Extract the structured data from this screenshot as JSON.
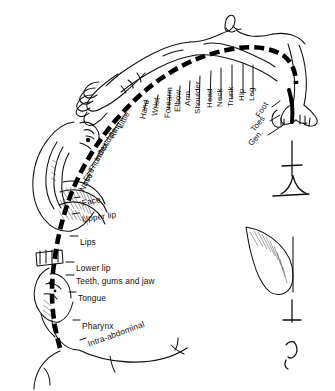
{
  "figure": {
    "name": "sensory-homunculus",
    "background_color": "#ffffff",
    "ink_color": "#000000",
    "arc": {
      "name": "cortical-sensory-strip",
      "style": "dashed-thick-black-arc"
    },
    "labels_upper": [
      {
        "text": "Little",
        "x": 120,
        "y": 124,
        "rot": -62
      },
      {
        "text": "Ring",
        "x": 112,
        "y": 134,
        "rot": -62
      },
      {
        "text": "Middle",
        "x": 104,
        "y": 146,
        "rot": -62
      },
      {
        "text": "Index",
        "x": 97,
        "y": 157,
        "rot": -62
      },
      {
        "text": "Thumb",
        "x": 91,
        "y": 168,
        "rot": -62
      },
      {
        "text": "Eye",
        "x": 86,
        "y": 177,
        "rot": -62
      },
      {
        "text": "Nose",
        "x": 82,
        "y": 187,
        "rot": -62
      },
      {
        "text": "Hand",
        "x": 143,
        "y": 115,
        "rot": -78
      },
      {
        "text": "Wrist",
        "x": 155,
        "y": 112,
        "rot": -82
      },
      {
        "text": "Forearm",
        "x": 168,
        "y": 114,
        "rot": -86
      },
      {
        "text": "Elbow",
        "x": 178,
        "y": 108,
        "rot": -88
      },
      {
        "text": "Arm",
        "x": 188,
        "y": 102,
        "rot": -90
      },
      {
        "text": "Shoulder",
        "x": 198,
        "y": 110,
        "rot": -90
      },
      {
        "text": "Head",
        "x": 210,
        "y": 104,
        "rot": -90
      },
      {
        "text": "Neck",
        "x": 220,
        "y": 103,
        "rot": -90
      },
      {
        "text": "Trunk",
        "x": 231,
        "y": 103,
        "rot": -90
      },
      {
        "text": "Hip",
        "x": 242,
        "y": 97,
        "rot": -90
      },
      {
        "text": "Leg",
        "x": 252,
        "y": 97,
        "rot": -90
      },
      {
        "text": "Foot",
        "x": 258,
        "y": 113,
        "rot": -58
      },
      {
        "text": "Toes",
        "x": 253,
        "y": 127,
        "rot": -52
      },
      {
        "text": "Gen.",
        "x": 250,
        "y": 141,
        "rot": -48
      }
    ],
    "labels_lower": [
      {
        "text": "Face",
        "x": 82,
        "y": 199,
        "rot": -12
      },
      {
        "text": "Upper lip",
        "x": 82,
        "y": 215,
        "rot": -8
      },
      {
        "text": "Lips",
        "x": 80,
        "y": 238,
        "rot": 0
      },
      {
        "text": "Lower lip",
        "x": 76,
        "y": 264,
        "rot": 0
      },
      {
        "text": "Teeth, gums and jaw",
        "x": 76,
        "y": 277,
        "rot": 0
      },
      {
        "text": "Tongue",
        "x": 78,
        "y": 294,
        "rot": 0
      },
      {
        "text": "Pharynx",
        "x": 82,
        "y": 322,
        "rot": 0
      },
      {
        "text": "Intra-abdominal",
        "x": 88,
        "y": 340,
        "rot": -20
      }
    ],
    "leader_lines": {
      "name": "label-leader-dashes",
      "count": 29
    },
    "body_parts_drawn": [
      "homunculus-head",
      "homunculus-hand-left",
      "homunculus-face-lips",
      "homunculus-tongue",
      "homunculus-leg-foot-right",
      "detail-figure-upper",
      "detail-figure-lower",
      "detail-genital-shape"
    ]
  }
}
